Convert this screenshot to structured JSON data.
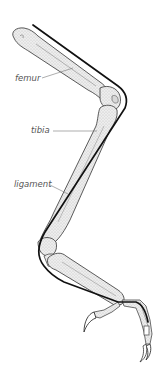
{
  "diagram": {
    "labels": [
      {
        "id": "femur",
        "text": "femur"
      },
      {
        "id": "tibia",
        "text": "tibia"
      },
      {
        "id": "ligament",
        "text": "ligament"
      }
    ]
  },
  "colors": {
    "background": "#ffffff",
    "bone_fill": "#e6e6e6",
    "bone_stroke": "#4a4a4a",
    "ligament": "#111111",
    "label_text": "#555555",
    "leader_line": "#777777"
  }
}
